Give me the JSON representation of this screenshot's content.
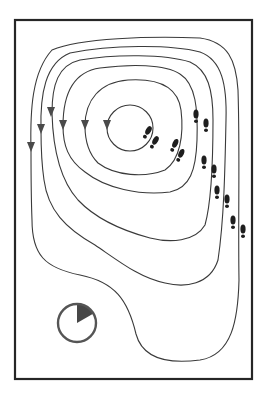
{
  "diagram": {
    "title": "Contour map with flow arrows, footprint trail and time indicator",
    "frame": {
      "x": 15,
      "y": 20,
      "width": 237,
      "height": 359,
      "stroke": "#262626"
    },
    "contour_count": 6,
    "arrow_direction": "down",
    "arrow_count": 6,
    "footprint_pair_count": 7,
    "footprint_trail_direction": "from center toward right edge",
    "clock": {
      "label": "time-elapsed-indicator",
      "filled_fraction": 0.125,
      "center": [
        77,
        323
      ],
      "radius": 19
    },
    "colors": {
      "background": "#ffffff",
      "line": "#3a3a3a",
      "arrow": "#4a4a4a",
      "footprint": "#1e1e1e",
      "clock_ring": "#555555",
      "clock_wedge": "#474747"
    }
  }
}
